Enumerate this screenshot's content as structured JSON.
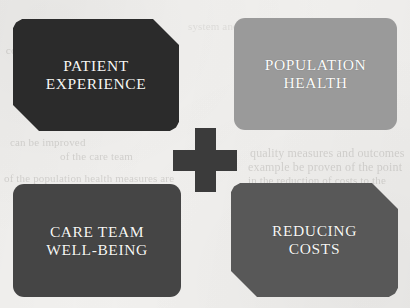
{
  "figure": {
    "type": "quadruple-aim-diagram",
    "background_color": "#f2f1ef",
    "center_symbol": "plus-icon",
    "center_symbol_color": "#3b3b3b"
  },
  "quadrants": [
    {
      "id": "patient-experience",
      "label": "PATIENT\nEXPERIENCE",
      "line1": "PATIENT",
      "line2": "EXPERIENCE",
      "fill_color": "#2b2b2b",
      "text_color": "#f7f7f5",
      "corner_style": "chamfer-top-right-bottom-left",
      "position": "top-left"
    },
    {
      "id": "population-health",
      "label": "POPULATION\nHEALTH",
      "line1": "POPULATION",
      "line2": "HEALTH",
      "fill_color": "#9a9a9a",
      "text_color": "#fbfbfa",
      "corner_style": "rounded-all",
      "position": "top-right"
    },
    {
      "id": "care-team-well-being",
      "label": "CARE TEAM\nWELL-BEING",
      "line1": "CARE TEAM",
      "line2": "WELL-BEING",
      "fill_color": "#454545",
      "text_color": "#f7f7f5",
      "corner_style": "rounded-all",
      "position": "bottom-left"
    },
    {
      "id": "reducing-costs",
      "label": "REDUCING\nCOSTS",
      "line1": "REDUCING",
      "line2": "COSTS",
      "fill_color": "#585858",
      "text_color": "#f7f7f5",
      "corner_style": "chamfer-top-right-bottom-left",
      "position": "bottom-right"
    }
  ],
  "background_ghost_text": {
    "note": "faint bleed-through text from reverse side of the scanned page",
    "lines": [
      "consider ways in which",
      "can be improved",
      "of the care team",
      "quality measures and outcomes",
      "example be proven of the point",
      "of the population health measures are",
      "in the reduction of costs to the",
      "system and the improvement of"
    ]
  }
}
